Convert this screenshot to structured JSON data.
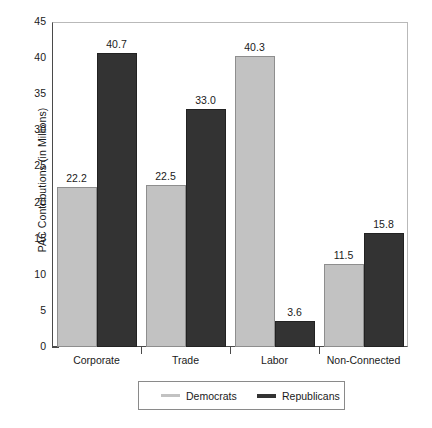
{
  "chart_data": {
    "type": "bar",
    "title": "",
    "xlabel": "",
    "ylabel": "PAC Contributions (in Millions)",
    "ylim": [
      0,
      45
    ],
    "yticks": [
      0,
      5,
      10,
      15,
      20,
      25,
      30,
      35,
      40,
      45
    ],
    "grid": false,
    "legend_position": "bottom",
    "categories": [
      "Corporate",
      "Trade",
      "Labor",
      "Non-Connected"
    ],
    "series": [
      {
        "name": "Democrats",
        "color": "#c2c2c2",
        "values": [
          22.2,
          22.5,
          40.3,
          11.5
        ],
        "labels": [
          "22.2",
          "22.5",
          "40.3",
          "11.5"
        ]
      },
      {
        "name": "Republicans",
        "color": "#333333",
        "values": [
          40.7,
          33.0,
          3.6,
          15.8
        ],
        "labels": [
          "40.7",
          "33.0",
          "3.6",
          "15.8"
        ]
      }
    ]
  },
  "axis": {
    "y_title": "PAC Contributions (in Millions)",
    "tick_labels": [
      "45",
      "40",
      "35",
      "30",
      "25",
      "20",
      "15",
      "10",
      "5",
      "0"
    ]
  },
  "legend": {
    "items": [
      {
        "label": "Democrats",
        "swatch": "dem"
      },
      {
        "label": "Republicans",
        "swatch": "rep"
      }
    ]
  }
}
